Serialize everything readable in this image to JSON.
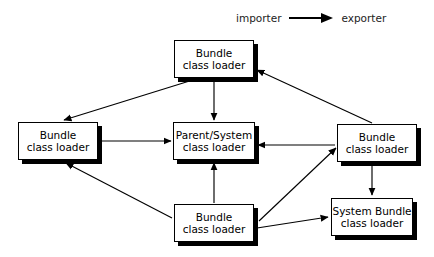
{
  "diagram": {
    "legend": {
      "importer_label": "importer",
      "exporter_label": "exporter",
      "arrow_icon": "arrow-right-icon",
      "meaning": "arrow points from importer to exporter"
    },
    "colors": {
      "stroke": "#000000",
      "fill": "#ffffff",
      "text": "#000000",
      "legend_text": "#222222"
    },
    "nodes": [
      {
        "id": "top-bundle",
        "line1": "Bundle",
        "line2": "class loader",
        "x": 174,
        "y": 40,
        "w": 80,
        "h": 38
      },
      {
        "id": "left-bundle",
        "line1": "Bundle",
        "line2": "class loader",
        "x": 18,
        "y": 122,
        "w": 80,
        "h": 38
      },
      {
        "id": "parent-system",
        "line1": "Parent/System",
        "line2": "class loader",
        "x": 173,
        "y": 122,
        "w": 82,
        "h": 38
      },
      {
        "id": "right-bundle",
        "line1": "Bundle",
        "line2": "class loader",
        "x": 337,
        "y": 124,
        "w": 80,
        "h": 38
      },
      {
        "id": "bottom-bundle",
        "line1": "Bundle",
        "line2": "class loader",
        "x": 174,
        "y": 204,
        "w": 80,
        "h": 38
      },
      {
        "id": "system-bundle",
        "line1": "System Bundle",
        "line2": "class loader",
        "x": 331,
        "y": 198,
        "w": 82,
        "h": 38
      }
    ],
    "edges": [
      {
        "from": "top-bundle",
        "to": "left-bundle",
        "x1": 196,
        "y1": 79,
        "x2": 64,
        "y2": 120
      },
      {
        "from": "top-bundle",
        "to": "parent-system",
        "x1": 214,
        "y1": 79,
        "x2": 214,
        "y2": 120
      },
      {
        "from": "right-bundle",
        "to": "top-bundle",
        "x1": 372,
        "y1": 123,
        "x2": 257,
        "y2": 70
      },
      {
        "from": "left-bundle",
        "to": "parent-system",
        "x1": 100,
        "y1": 141,
        "x2": 171,
        "y2": 141
      },
      {
        "from": "right-bundle",
        "to": "parent-system",
        "x1": 335,
        "y1": 145,
        "x2": 258,
        "y2": 145
      },
      {
        "from": "bottom-bundle",
        "to": "left-bundle",
        "x1": 172,
        "y1": 218,
        "x2": 66,
        "y2": 163
      },
      {
        "from": "bottom-bundle",
        "to": "parent-system",
        "x1": 214,
        "y1": 203,
        "x2": 214,
        "y2": 163
      },
      {
        "from": "bottom-bundle",
        "to": "right-bundle",
        "x1": 259,
        "y1": 221,
        "x2": 336,
        "y2": 148
      },
      {
        "from": "bottom-bundle",
        "to": "system-bundle",
        "x1": 257,
        "y1": 228,
        "x2": 328,
        "y2": 217
      },
      {
        "from": "right-bundle",
        "to": "system-bundle",
        "x1": 372,
        "y1": 165,
        "x2": 372,
        "y2": 195
      }
    ]
  }
}
